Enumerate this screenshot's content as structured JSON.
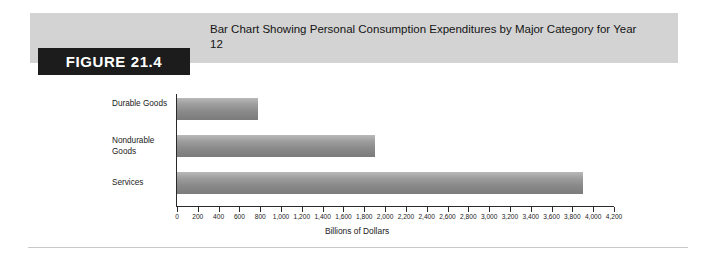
{
  "figure": {
    "tag_label": "FIGURE 21.4",
    "title": "Bar Chart Showing Personal Consumption Expenditures by Major Category for Year 12"
  },
  "colors": {
    "banner_bg": "#d3d3d3",
    "tag_bg": "#1c1c1c",
    "tag_text": "#ffffff",
    "bar_light": "#b9b9b9",
    "bar_dark": "#7b7b7b",
    "axis": "#2a2a2a",
    "rule": "#c9c9c9"
  },
  "chart_data": {
    "type": "bar",
    "orientation": "horizontal",
    "title": "Bar Chart Showing Personal Consumption Expenditures by Major Category for Year 12",
    "categories": [
      "Durable Goods",
      "Nondurable Goods",
      "Services"
    ],
    "values": [
      780,
      1900,
      3900
    ],
    "xlabel": "Billions of Dollars",
    "ylabel": "",
    "xlim": [
      0,
      4200
    ],
    "xticks": [
      0,
      200,
      400,
      600,
      800,
      1000,
      1200,
      1400,
      1600,
      1800,
      2000,
      2200,
      2400,
      2600,
      2800,
      3000,
      3200,
      3400,
      3600,
      3800,
      4000,
      4200
    ],
    "xtick_labels": [
      "0",
      "200",
      "400",
      "600",
      "800",
      "1,000",
      "1,200",
      "1,400",
      "1,600",
      "1,800",
      "2,000",
      "2,200",
      "2,400",
      "2,600",
      "2,800",
      "3,000",
      "3,200",
      "3,400",
      "3,600",
      "3,800",
      "4,000",
      "4,200"
    ],
    "grid": false,
    "legend": false
  }
}
